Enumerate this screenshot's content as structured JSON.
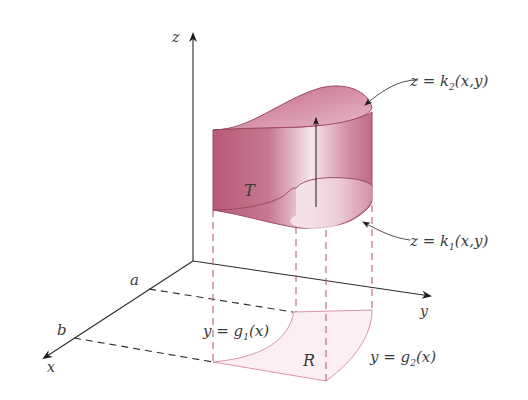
{
  "figure": {
    "axes": {
      "z_label": "z",
      "y_label": "y",
      "x_label": "x"
    },
    "bounds": {
      "a_label": "a",
      "b_label": "b"
    },
    "solid_label": "T",
    "region_label": "R",
    "surfaces": {
      "upper": {
        "lhs": "z = k",
        "sub": "2",
        "rhs": "(x,y)"
      },
      "lower": {
        "lhs": "z = k",
        "sub": "1",
        "rhs": "(x,y)"
      }
    },
    "curves": {
      "g1": {
        "lhs": "y = g",
        "sub": "1",
        "rhs": "(x)"
      },
      "g2": {
        "lhs": "y = g",
        "sub": "2",
        "rhs": "(x)"
      }
    },
    "colors": {
      "solid_fill": "#c06a86",
      "solid_light": "#f3dde5",
      "region_fill": "#fbeff3",
      "axis": "#2b2b2b",
      "text": "#3a3a3a"
    }
  }
}
